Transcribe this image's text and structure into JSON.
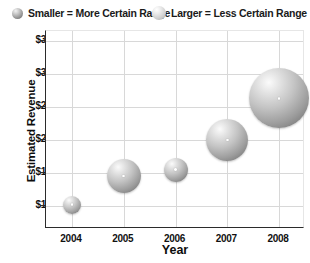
{
  "legend": {
    "items": [
      {
        "icon": "small-sphere-icon",
        "label": "Smaller = More Certain Range"
      },
      {
        "icon": "large-sphere-icon",
        "label": "Larger = Less Certain Range"
      }
    ]
  },
  "chart_data": {
    "type": "scatter",
    "title": "",
    "xlabel": "Year",
    "ylabel": "Estimated Revenue",
    "categories": [
      "2004",
      "2005",
      "2006",
      "2007",
      "2008"
    ],
    "x": [
      2004,
      2005,
      2006,
      2007,
      2008
    ],
    "values": [
      10.2,
      14.5,
      15.5,
      20.0,
      26.3
    ],
    "sizes": [
      9,
      17,
      12,
      21,
      30
    ],
    "size_meaning": "bubble radius in px — larger radius = less certain range",
    "ytick_labels": [
      "$35m",
      "$30m",
      "$25m",
      "$20m",
      "$15m",
      "$10m"
    ],
    "ytick_values": [
      35,
      30,
      25,
      20,
      15,
      10
    ],
    "ylim": [
      6.5,
      36.5
    ],
    "xlim": [
      2003.5,
      2008.5
    ],
    "grid": true,
    "legend_position": "top",
    "colors": {
      "bubble_light": "#fbfbfb",
      "bubble_dark": "#6e6e6e",
      "gridline": "#d8d8d8",
      "axis": "#2b2b2b",
      "text": "#111111",
      "background": "#ffffff"
    }
  }
}
